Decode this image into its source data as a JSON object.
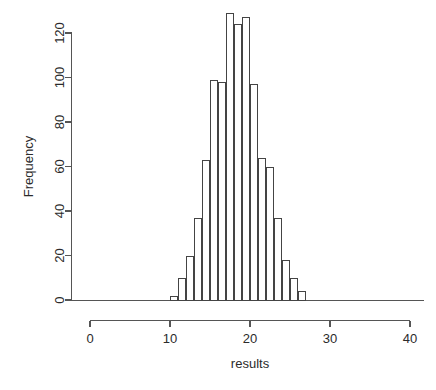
{
  "chart_data": {
    "type": "bar",
    "title": "",
    "subtitle": "",
    "xlabel": "results",
    "ylabel": "Frequency",
    "xlim": [
      0,
      40
    ],
    "ylim": [
      0,
      130
    ],
    "grid": false,
    "legend": null,
    "bin_width": 1,
    "bin_edges": [
      10,
      11,
      12,
      13,
      14,
      15,
      16,
      17,
      18,
      19,
      20,
      21,
      22,
      23,
      24,
      25,
      26,
      27
    ],
    "categories": [
      "10-11",
      "11-12",
      "12-13",
      "13-14",
      "14-15",
      "15-16",
      "16-17",
      "17-18",
      "18-19",
      "19-20",
      "20-21",
      "21-22",
      "22-23",
      "23-24",
      "24-25",
      "25-26",
      "26-27"
    ],
    "values": [
      2,
      10,
      20,
      37,
      63,
      99,
      98,
      129,
      124,
      127,
      97,
      64,
      60,
      37,
      18,
      10,
      4
    ],
    "x_ticks": [
      {
        "value": 0,
        "label": "0"
      },
      {
        "value": 10,
        "label": "10"
      },
      {
        "value": 20,
        "label": "20"
      },
      {
        "value": 30,
        "label": "30"
      },
      {
        "value": 40,
        "label": "40"
      }
    ],
    "y_ticks": [
      {
        "value": 0,
        "label": "0"
      },
      {
        "value": 20,
        "label": "20"
      },
      {
        "value": 40,
        "label": "40"
      },
      {
        "value": 60,
        "label": "60"
      },
      {
        "value": 80,
        "label": "80"
      },
      {
        "value": 100,
        "label": "100"
      },
      {
        "value": 120,
        "label": "120"
      }
    ],
    "colors": {
      "bar_fill": "#ffffff",
      "bar_stroke": "#444444",
      "axis": "#555555",
      "text": "#2b2b2b",
      "background": "#ffffff"
    }
  }
}
